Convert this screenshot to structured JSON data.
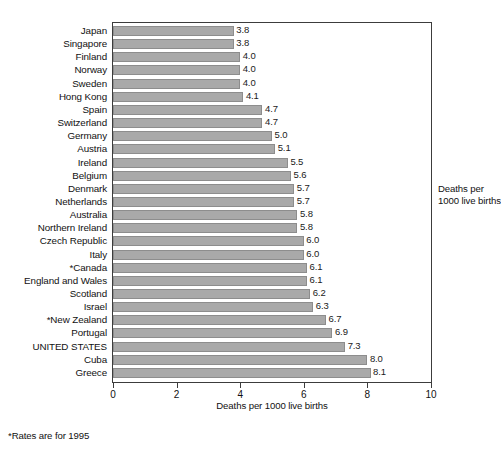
{
  "chart_data": {
    "type": "bar",
    "orientation": "horizontal",
    "title": "",
    "xlabel": "Deaths per 1000 live births",
    "ylabel": "",
    "xlim": [
      0,
      10
    ],
    "xticks": [
      0,
      2,
      4,
      6,
      8,
      10
    ],
    "grid": false,
    "legend_position": "right-outside",
    "annotation_right": "Deaths per\n1000 live births",
    "annotation_right_line1": "Deaths per",
    "annotation_right_line2": "1000 live births",
    "footnote": "*Rates are for 1995",
    "bar_color": "#a9a9a9",
    "bar_edge_color": "#8d8d8d",
    "categories": [
      "Japan",
      "Singapore",
      "Finland",
      "Norway",
      "Sweden",
      "Hong Kong",
      "Spain",
      "Switzerland",
      "Germany",
      "Austria",
      "Ireland",
      "Belgium",
      "Denmark",
      "Netherlands",
      "Australia",
      "Northern Ireland",
      "Czech Republic",
      "Italy",
      "*Canada",
      "England and Wales",
      "Scotland",
      "Israel",
      "*New Zealand",
      "Portugal",
      "UNITED STATES",
      "Cuba",
      "Greece"
    ],
    "values": [
      3.8,
      3.8,
      4.0,
      4.0,
      4.0,
      4.1,
      4.7,
      4.7,
      5.0,
      5.1,
      5.5,
      5.6,
      5.7,
      5.7,
      5.8,
      5.8,
      6.0,
      6.0,
      6.1,
      6.1,
      6.2,
      6.3,
      6.7,
      6.9,
      7.3,
      8.0,
      8.1
    ],
    "value_labels": [
      "3.8",
      "3.8",
      "4.0",
      "4.0",
      "4.0",
      "4.1",
      "4.7",
      "4.7",
      "5.0",
      "5.1",
      "5.5",
      "5.6",
      "5.7",
      "5.7",
      "5.8",
      "5.8",
      "6.0",
      "6.0",
      "6.1",
      "6.1",
      "6.2",
      "6.3",
      "6.7",
      "6.9",
      "7.3",
      "8.0",
      "8.1"
    ]
  }
}
